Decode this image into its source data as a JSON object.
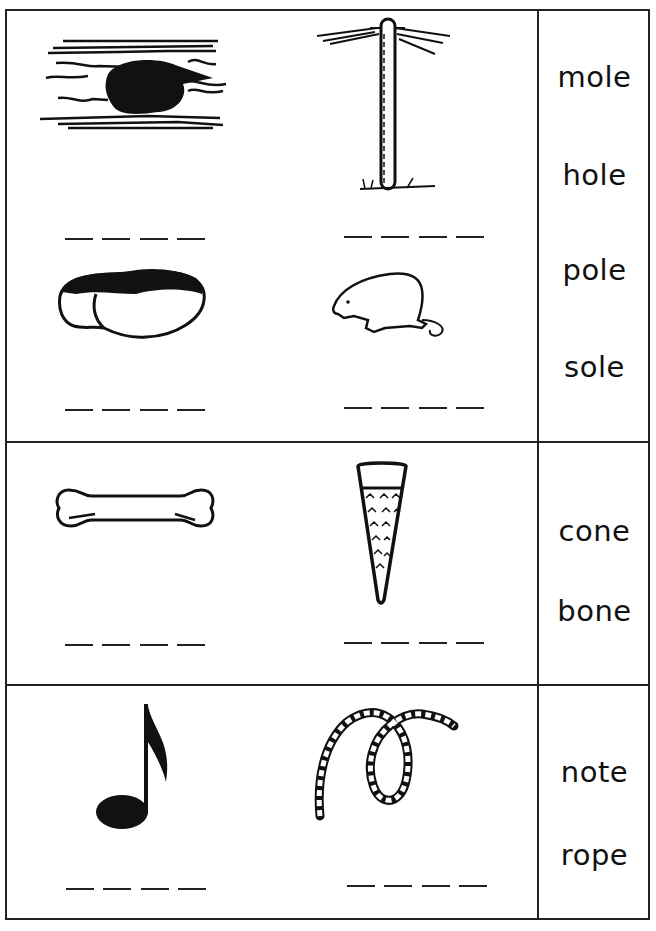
{
  "worksheet": {
    "sections": [
      {
        "id": "ole",
        "pictures": [
          {
            "name": "hole-picture",
            "answer_blank_count": 4
          },
          {
            "name": "pole-picture",
            "answer_blank_count": 4
          },
          {
            "name": "sole-picture",
            "answer_blank_count": 4
          },
          {
            "name": "mole-picture",
            "answer_blank_count": 4
          }
        ],
        "word_bank": [
          "mole",
          "hole",
          "pole",
          "sole"
        ]
      },
      {
        "id": "one",
        "pictures": [
          {
            "name": "bone-picture",
            "answer_blank_count": 4
          },
          {
            "name": "cone-picture",
            "answer_blank_count": 4
          }
        ],
        "word_bank": [
          "cone",
          "bone"
        ]
      },
      {
        "id": "note-rope",
        "pictures": [
          {
            "name": "note-picture",
            "answer_blank_count": 4
          },
          {
            "name": "rope-picture",
            "answer_blank_count": 4
          }
        ],
        "word_bank": [
          "note",
          "rope"
        ]
      }
    ]
  },
  "colors": {
    "ink": "#111111",
    "paper": "#ffffff"
  }
}
